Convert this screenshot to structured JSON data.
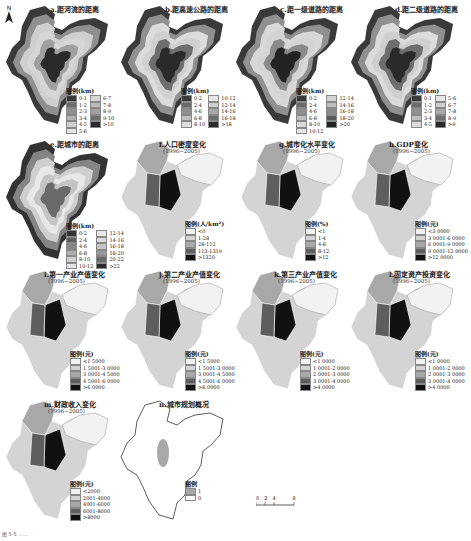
{
  "figure": {
    "north_label": "N",
    "scale_bar": {
      "ticks": [
        "0",
        "2",
        "4",
        "8"
      ],
      "unit": "km"
    },
    "caption": "图 5-5  ……"
  },
  "panels": [
    {
      "id": "a",
      "title": "a.距河流的距离",
      "subtitle": "",
      "legend_title": "图例(km)",
      "legend": [
        [
          "0-1",
          "#3a3a3a"
        ],
        [
          "1-2",
          "#6a6a6a"
        ],
        [
          "2-3",
          "#909090"
        ],
        [
          "3-4",
          "#b3b3b3"
        ],
        [
          "4-5",
          "#cfcfcf"
        ],
        [
          "5-6",
          "#e4e4e4"
        ],
        [
          "6-7",
          "#d6d6d6"
        ],
        [
          "7-8",
          "#bcbcbc"
        ],
        [
          "8-9",
          "#a0a0a0"
        ],
        [
          "9-10",
          "#707070"
        ],
        [
          ">10",
          "#2a2a2a"
        ]
      ]
    },
    {
      "id": "b",
      "title": "b.距高速公路的距离",
      "subtitle": "",
      "legend_title": "图例(km)",
      "legend": [
        [
          "0-2",
          "#3a3a3a"
        ],
        [
          "2-4",
          "#6a6a6a"
        ],
        [
          "4-6",
          "#909090"
        ],
        [
          "6-8",
          "#c0c0c0"
        ],
        [
          "8-10",
          "#dcdcdc"
        ],
        [
          "10-12",
          "#e6e6e6"
        ],
        [
          "12-14",
          "#d0d0d0"
        ],
        [
          "14-16",
          "#a8a8a8"
        ],
        [
          "16-18",
          "#6e6e6e"
        ],
        [
          ">18",
          "#2a2a2a"
        ]
      ]
    },
    {
      "id": "c",
      "title": "c.距一级道路的距离",
      "subtitle": "",
      "legend_title": "图例(km)",
      "legend": [
        [
          "0-2",
          "#3a3a3a"
        ],
        [
          "2-4",
          "#6a6a6a"
        ],
        [
          "4-6",
          "#909090"
        ],
        [
          "6-8",
          "#c0c0c0"
        ],
        [
          "8-10",
          "#d8d8d8"
        ],
        [
          "10-12",
          "#e6e6e6"
        ],
        [
          "12-14",
          "#d4d4d4"
        ],
        [
          "14-16",
          "#bdbdbd"
        ],
        [
          "16-18",
          "#8a8a8a"
        ],
        [
          "18-20",
          "#5a5a5a"
        ],
        [
          ">20",
          "#222222"
        ]
      ]
    },
    {
      "id": "d",
      "title": "d.距二级道路的距离",
      "subtitle": "",
      "legend_title": "图例(km)",
      "legend": [
        [
          "0-1",
          "#3a3a3a"
        ],
        [
          "1-2",
          "#6a6a6a"
        ],
        [
          "2-3",
          "#909090"
        ],
        [
          "3-4",
          "#c0c0c0"
        ],
        [
          "4-5",
          "#dcdcdc"
        ],
        [
          "5-6",
          "#e6e6e6"
        ],
        [
          "6-7",
          "#cfcfcf"
        ],
        [
          "7-8",
          "#a8a8a8"
        ],
        [
          "8-9",
          "#6e6e6e"
        ],
        [
          ">9",
          "#2a2a2a"
        ]
      ]
    },
    {
      "id": "e",
      "title": "e.距城市的距离",
      "subtitle": "",
      "legend_title": "图例(km)",
      "legend": [
        [
          "0-2",
          "#333333"
        ],
        [
          "2-4",
          "#5e5e5e"
        ],
        [
          "4-6",
          "#858585"
        ],
        [
          "6-8",
          "#adadad"
        ],
        [
          "8-10",
          "#cfcfcf"
        ],
        [
          "10-12",
          "#e4e4e4"
        ],
        [
          "12-14",
          "#e8e8e8"
        ],
        [
          "14-16",
          "#dcdcdc"
        ],
        [
          "16-18",
          "#c4c4c4"
        ],
        [
          "18-20",
          "#9a9a9a"
        ],
        [
          "20-22",
          "#6a6a6a"
        ],
        [
          ">22",
          "#2a2a2a"
        ]
      ]
    },
    {
      "id": "f",
      "title": "f.人口密度变化",
      "subtitle": "(1996~2005)",
      "legend_title": "图例(人/km²)",
      "legend": [
        [
          "<0",
          "#f2f2f2"
        ],
        [
          "1-28",
          "#d4d4d4"
        ],
        [
          "28-112",
          "#a8a8a8"
        ],
        [
          "113-1319",
          "#5e5e5e"
        ],
        [
          ">1320",
          "#111111"
        ]
      ]
    },
    {
      "id": "g",
      "title": "g.城市化水平变化",
      "subtitle": "(1996~2005)",
      "legend_title": "图例(%)",
      "legend": [
        [
          "<1",
          "#f2f2f2"
        ],
        [
          "1-4",
          "#d4d4d4"
        ],
        [
          "4-8",
          "#a8a8a8"
        ],
        [
          "8-12",
          "#5e5e5e"
        ],
        [
          ">12",
          "#111111"
        ]
      ]
    },
    {
      "id": "h",
      "title": "h.GDP变化",
      "subtitle": "(1996~2005)",
      "legend_title": "图例(元)",
      "legend": [
        [
          "<3 0000",
          "#f2f2f2"
        ],
        [
          "3 0001-6 0000",
          "#d4d4d4"
        ],
        [
          "6 0001-9 0000",
          "#a8a8a8"
        ],
        [
          "9 0001-12 0000",
          "#5e5e5e"
        ],
        [
          ">12 0000",
          "#111111"
        ]
      ]
    },
    {
      "id": "i",
      "title": "i.第一产业产值变化",
      "subtitle": "(1996~2005)",
      "legend_title": "图例(元)",
      "legend": [
        [
          "<1 5000",
          "#f2f2f2"
        ],
        [
          "1 5001-3 0000",
          "#d4d4d4"
        ],
        [
          "3 0001-4 5000",
          "#a8a8a8"
        ],
        [
          "4 5001-6 0000",
          "#5e5e5e"
        ],
        [
          ">6 0000",
          "#111111"
        ]
      ]
    },
    {
      "id": "j",
      "title": "j.第二产业产值变化",
      "subtitle": "(1996~2005)",
      "legend_title": "图例(元)",
      "legend": [
        [
          "<1 5000",
          "#f2f2f2"
        ],
        [
          "1 5001-3 0000",
          "#d4d4d4"
        ],
        [
          "3 0001-4 5000",
          "#a8a8a8"
        ],
        [
          "4 5001-6 0000",
          "#5e5e5e"
        ],
        [
          ">6 0000",
          "#111111"
        ]
      ]
    },
    {
      "id": "k",
      "title": "k.第三产业产值变化",
      "subtitle": "(1996~2005)",
      "legend_title": "图例(元)",
      "legend": [
        [
          "<1 0000",
          "#f2f2f2"
        ],
        [
          "1 0001-2 0000",
          "#d4d4d4"
        ],
        [
          "2 0001-3 0000",
          "#a8a8a8"
        ],
        [
          "3 0001-4 0000",
          "#5e5e5e"
        ],
        [
          ">4 0000",
          "#111111"
        ]
      ]
    },
    {
      "id": "l",
      "title": "l.固定资产投资变化",
      "subtitle": "(1996~2005)",
      "legend_title": "图例(元)",
      "legend": [
        [
          "<1 0000",
          "#f2f2f2"
        ],
        [
          "1 0001-2 0000",
          "#d4d4d4"
        ],
        [
          "2 0001-3 0000",
          "#a8a8a8"
        ],
        [
          "3 0001-4 0000",
          "#5e5e5e"
        ],
        [
          ">4 0000",
          "#111111"
        ]
      ]
    },
    {
      "id": "m",
      "title": "m.财政收入变化",
      "subtitle": "(1996~2005)",
      "legend_title": "图例(元)",
      "legend": [
        [
          "<2000",
          "#f2f2f2"
        ],
        [
          "2001-4000",
          "#d4d4d4"
        ],
        [
          "4001-6000",
          "#a8a8a8"
        ],
        [
          "6001-8000",
          "#5e5e5e"
        ],
        [
          ">8000",
          "#111111"
        ]
      ]
    },
    {
      "id": "n",
      "title": "n.城市规划概况",
      "subtitle": "",
      "legend_title": "图例",
      "legend": [
        [
          "1",
          "#a8a8a8"
        ],
        [
          "0",
          "#ffffff"
        ]
      ]
    }
  ]
}
